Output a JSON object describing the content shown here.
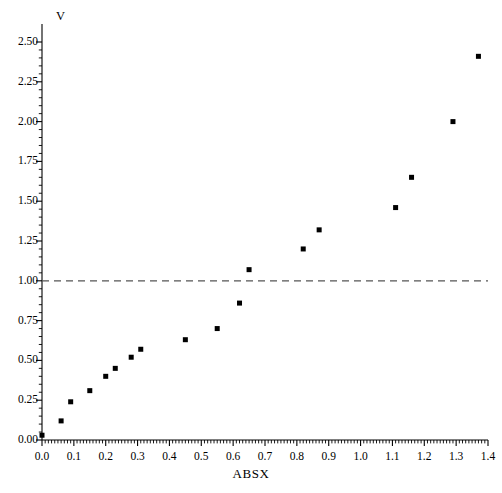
{
  "chart_data": {
    "type": "scatter",
    "title": "",
    "subtitle": "",
    "xlabel": "ABSX",
    "ylabel": "V",
    "xlim": [
      0.0,
      1.4
    ],
    "ylim": [
      0.0,
      2.5
    ],
    "grid": false,
    "legend": null,
    "x_ticks": [
      "0.0",
      "0.1",
      "0.2",
      "0.3",
      "0.4",
      "0.5",
      "0.6",
      "0.7",
      "0.8",
      "0.9",
      "1.0",
      "1.1",
      "1.2",
      "1.3",
      "1.4"
    ],
    "x_tick_values": [
      0.0,
      0.1,
      0.2,
      0.3,
      0.4,
      0.5,
      0.6,
      0.7,
      0.8,
      0.9,
      1.0,
      1.1,
      1.2,
      1.3,
      1.4
    ],
    "y_ticks": [
      "0.00",
      "0.25",
      "0.50",
      "0.75",
      "1.00",
      "1.25",
      "1.50",
      "1.75",
      "2.00",
      "2.25",
      "2.50"
    ],
    "y_tick_values": [
      0.0,
      0.25,
      0.5,
      0.75,
      1.0,
      1.25,
      1.5,
      1.75,
      2.0,
      2.25,
      2.5
    ],
    "minor_ticks_per_major_x": 10,
    "minor_ticks_per_major_y": 5,
    "marker": "square",
    "marker_size": 5,
    "marker_color": "#000000",
    "series": [
      {
        "name": "V vs ABSX",
        "x": [
          0.0,
          0.06,
          0.09,
          0.15,
          0.2,
          0.23,
          0.28,
          0.31,
          0.45,
          0.55,
          0.62,
          0.65,
          0.82,
          0.87,
          1.11,
          1.16,
          1.29,
          1.37
        ],
        "y": [
          0.03,
          0.12,
          0.24,
          0.31,
          0.4,
          0.45,
          0.52,
          0.57,
          0.63,
          0.7,
          0.86,
          1.07,
          1.2,
          1.32,
          1.46,
          1.65,
          2.0,
          2.41
        ]
      }
    ],
    "reference_lines": [
      {
        "name": "threshold-line",
        "orientation": "horizontal",
        "value": 1.0,
        "style": "dashed",
        "color": "#555555"
      }
    ]
  },
  "annotations": {
    "axis_color": "#000000",
    "background": "#ffffff"
  }
}
